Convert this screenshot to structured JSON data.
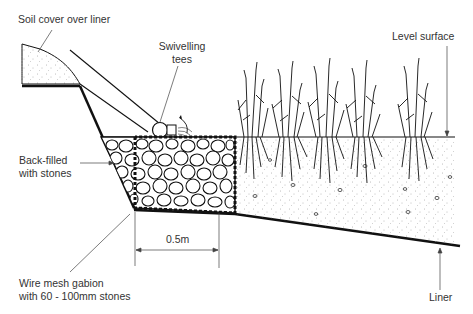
{
  "diagram": {
    "type": "cross-section",
    "labels": {
      "soil_cover": "Soil cover over liner",
      "swivelling_tees_line1": "Swivelling",
      "swivelling_tees_line2": "tees",
      "level_surface": "Level surface",
      "back_filled_line1": "Back-filled",
      "back_filled_line2": "with stones",
      "gabion_line1": "Wire mesh gabion",
      "gabion_line2": "with 60 - 100mm stones",
      "dimension": "0.5m",
      "liner": "Liner"
    },
    "colors": {
      "ink": "#111111",
      "label_text": "#333333",
      "background": "#ffffff"
    }
  }
}
